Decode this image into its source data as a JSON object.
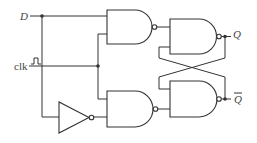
{
  "diagram": {
    "type": "gated D latch (NAND)",
    "labels": {
      "d": "D",
      "clk": "clk",
      "q": "Q",
      "q_bar": "Q"
    },
    "components": [
      {
        "id": "nand-1",
        "kind": "NAND",
        "inputs": [
          "D",
          "clk"
        ]
      },
      {
        "id": "nand-2",
        "kind": "NAND",
        "inputs": [
          "clk",
          "NOT D"
        ]
      },
      {
        "id": "nand-3",
        "kind": "NAND",
        "inputs": [
          "nand-1",
          "Q_bar"
        ],
        "output": "Q"
      },
      {
        "id": "nand-4",
        "kind": "NAND",
        "inputs": [
          "Q",
          "nand-2"
        ],
        "output": "Q_bar"
      },
      {
        "id": "inverter",
        "kind": "NOT",
        "inputs": [
          "D"
        ]
      }
    ],
    "colors": {
      "line": "#333333",
      "text": "#444444",
      "background": "#ffffff"
    }
  }
}
